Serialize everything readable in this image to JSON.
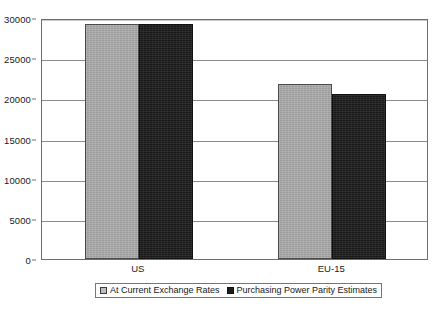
{
  "chart_data": {
    "type": "bar",
    "title": "",
    "subtitle": "",
    "xlabel": "",
    "ylabel": "",
    "categories": [
      "US",
      "EU-15"
    ],
    "series": [
      {
        "name": "At Current Exchange Rates",
        "color": "#a9a9a9",
        "values": [
          29200,
          21800
        ]
      },
      {
        "name": "Purchasing Power Parity Estimates",
        "color": "#222222",
        "values": [
          29200,
          20600
        ]
      }
    ],
    "ylim": [
      0,
      30000
    ],
    "yticks": [
      0,
      5000,
      10000,
      15000,
      20000,
      25000,
      30000
    ],
    "ytick_labels": [
      "0",
      "5000",
      "10000",
      "15000",
      "20000",
      "25000",
      "30000"
    ],
    "grid": true,
    "grid_axis": "y",
    "legend_position": "bottom",
    "plot_border": true,
    "background_color": "#ffffff",
    "axis_color": "#6e6e6e",
    "gridline_color": "#8a8a8a"
  }
}
